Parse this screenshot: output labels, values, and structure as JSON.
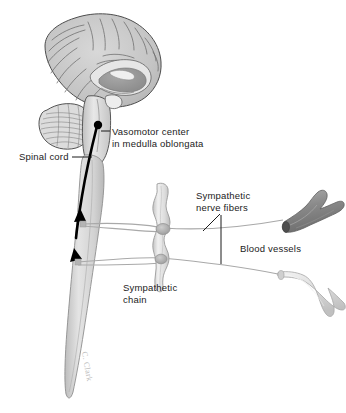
{
  "figure": {
    "background_color": "#ffffff",
    "ink_color": "#1b1b1b",
    "labels": {
      "vasomotor_center": "Vasomotor center\nin medulla oblongata",
      "spinal_cord": "Spinal cord",
      "sympathetic_nerve_fibers": "Sympathetic\nnerve fibers",
      "blood_vessels": "Blood vessels",
      "sympathetic_chain": "Sympathetic\nchain"
    },
    "structures": {
      "brain": "mid-sagittal cerebrum with gyri and corpus callosum",
      "cerebellum": "foliated cerebellum",
      "brainstem": "brainstem and medulla oblongata",
      "spinal_cord": "tapering spinal cord",
      "sympathetic_chain": "beaded paravertebral ganglion chain",
      "upper_blood_vessel": "branching vessel, dark gray",
      "lower_blood_vessel": "branching vessel, light gray",
      "efferent_pathway": "black descending tract with two arrowheads"
    },
    "colors": {
      "brain_fill": "#c9c9c9",
      "brain_outline": "#4a4a4a",
      "cord_fill": "#d8d8d8",
      "nerve_line": "#a8a8a8",
      "tract_black": "#000000",
      "vessel_dark": "#8c8c8c",
      "vessel_light": "#d5d5d5",
      "ganglion_node": "#b0b0b0"
    },
    "signature": "C. Clark"
  }
}
